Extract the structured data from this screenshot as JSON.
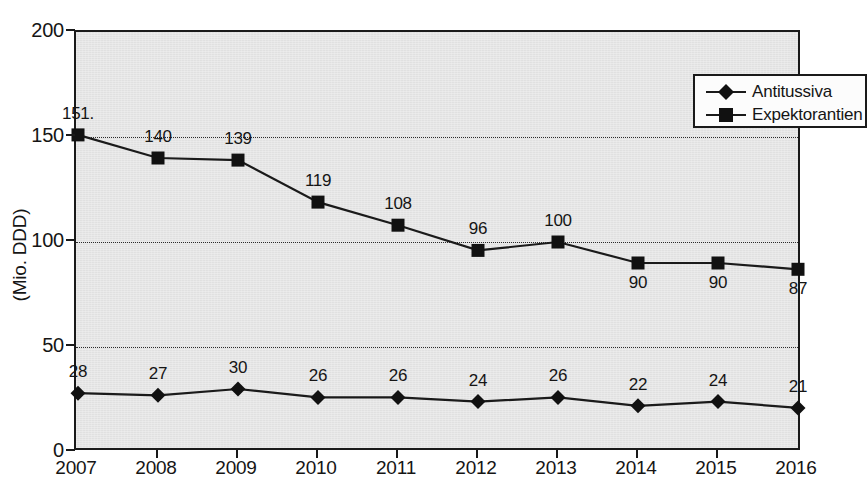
{
  "chart_data": {
    "type": "line",
    "title": "",
    "xlabel": "",
    "ylabel": "(Mio. DDD)",
    "x": [
      2007,
      2008,
      2009,
      2010,
      2011,
      2012,
      2013,
      2014,
      2015,
      2016
    ],
    "categories": [
      "2007",
      "2008",
      "2009",
      "2010",
      "2011",
      "2012",
      "2013",
      "2014",
      "2015",
      "2016"
    ],
    "ylim": [
      0,
      200
    ],
    "yticks": [
      0,
      50,
      100,
      150,
      200
    ],
    "ytick_labels": [
      "0",
      "50",
      "100",
      "150",
      "200"
    ],
    "gridlines_y": [
      50,
      100,
      150
    ],
    "grid": true,
    "legend_position": "top-right",
    "series": [
      {
        "name": "Antitussiva",
        "marker": "diamond",
        "values": [
          28,
          27,
          30,
          26,
          26,
          24,
          26,
          22,
          24,
          21
        ],
        "labels": [
          "28",
          "27",
          "30",
          "26",
          "26",
          "24",
          "26",
          "22",
          "24",
          "21"
        ],
        "label_positions": [
          "above",
          "above",
          "above",
          "above",
          "above",
          "above",
          "above",
          "above",
          "above",
          "above"
        ]
      },
      {
        "name": "Expektorantien",
        "marker": "square",
        "values": [
          151,
          140,
          139,
          119,
          108,
          96,
          100,
          90,
          90,
          87
        ],
        "labels": [
          "151.",
          "140",
          "139",
          "119",
          "108",
          "96",
          "100",
          "90",
          "90",
          "87"
        ],
        "label_positions": [
          "above",
          "above",
          "above",
          "above",
          "above",
          "above",
          "above",
          "below",
          "below",
          "below"
        ]
      }
    ]
  },
  "legend": {
    "entries": [
      {
        "label": "Antitussiva",
        "marker": "diamond"
      },
      {
        "label": "Expektorantien",
        "marker": "square"
      }
    ]
  },
  "colors": {
    "plot_background": "#e4e4e4",
    "ink": "#1a1a1a",
    "text": "#151515",
    "gridline": "#2b2b2b",
    "legend_background": "#fcfcfc",
    "page_background": "#ffffff"
  }
}
